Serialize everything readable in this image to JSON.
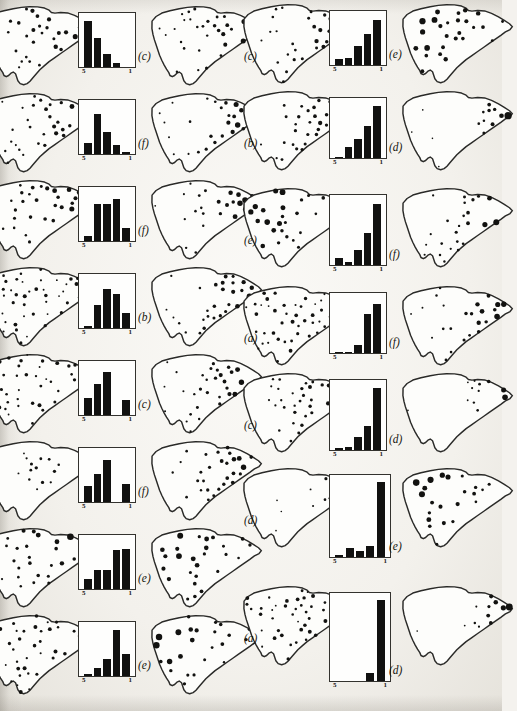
{
  "page": {
    "kind": "scanned-book-figure-page",
    "map_shape": "south-carolina-outline",
    "histogram_axis": {
      "left_tick": "5",
      "right_tick": "1"
    },
    "colors": {
      "ink": "#121210",
      "paper": "#f4f2ee",
      "outline": "#2a2a28"
    }
  },
  "columns": [
    {
      "name": "left-column",
      "rows": [
        {
          "row": 1,
          "left_map": {
            "label": ")",
            "dot_count": 30,
            "pattern": "northeast-heavy"
          },
          "histogram": {
            "type": "bar",
            "categories": [
              "5",
              "4",
              "3",
              "2",
              "1"
            ],
            "values": [
              92,
              58,
              26,
              9,
              0
            ],
            "ylim": [
              0,
              100
            ]
          },
          "right_map_label": "(c)",
          "right_map": {
            "dot_count": 30,
            "pattern": "east-heavy"
          }
        },
        {
          "row": 2,
          "left_map": {
            "label": ")",
            "dot_count": 32,
            "pattern": "east-heavy"
          },
          "histogram": {
            "type": "bar",
            "categories": [
              "5",
              "4",
              "3",
              "2",
              "1"
            ],
            "values": [
              22,
              80,
              44,
              18,
              4
            ],
            "ylim": [
              0,
              100
            ]
          },
          "right_map_label": "(f)",
          "right_map": {
            "dot_count": 26,
            "pattern": "east-large"
          }
        },
        {
          "row": 3,
          "left_map": {
            "label": ")",
            "dot_count": 30,
            "pattern": "northeast-heavy"
          },
          "histogram": {
            "type": "bar",
            "categories": [
              "5",
              "4",
              "3",
              "2",
              "1"
            ],
            "values": [
              10,
              74,
              74,
              84,
              26
            ],
            "ylim": [
              0,
              100
            ]
          },
          "right_map_label": "(f)",
          "right_map": {
            "dot_count": 24,
            "pattern": "east-large"
          }
        },
        {
          "row": 4,
          "left_map": {
            "label": ")",
            "dot_count": 44,
            "pattern": "uniform"
          },
          "histogram": {
            "type": "bar",
            "categories": [
              "5",
              "4",
              "3",
              "2",
              "1"
            ],
            "values": [
              4,
              46,
              78,
              68,
              30
            ],
            "ylim": [
              0,
              100
            ]
          },
          "right_map_label": "(b)",
          "right_map": {
            "dot_count": 28,
            "pattern": "east-heavy"
          }
        },
        {
          "row": 5,
          "left_map": {
            "label": ")",
            "dot_count": 40,
            "pattern": "uniform"
          },
          "histogram": {
            "type": "bar",
            "categories": [
              "5",
              "4",
              "3",
              "2",
              "1"
            ],
            "values": [
              34,
              62,
              86,
              0,
              30
            ],
            "ylim": [
              0,
              100
            ]
          },
          "right_map_label": "(c)",
          "right_map": {
            "dot_count": 30,
            "pattern": "east-heavy"
          }
        },
        {
          "row": 6,
          "left_map": {
            "label": ")",
            "dot_count": 14,
            "pattern": "central-cluster"
          },
          "histogram": {
            "type": "bar",
            "categories": [
              "5",
              "4",
              "3",
              "2",
              "1"
            ],
            "values": [
              32,
              56,
              84,
              0,
              36
            ],
            "ylim": [
              0,
              100
            ]
          },
          "right_map_label": "(f)",
          "right_map": {
            "dot_count": 28,
            "pattern": "east-heavy"
          }
        },
        {
          "row": 7,
          "left_map": {
            "label": ")",
            "dot_count": 28,
            "pattern": "northeast-large"
          },
          "histogram": {
            "type": "bar",
            "categories": [
              "5",
              "4",
              "3",
              "2",
              "1"
            ],
            "values": [
              20,
              38,
              38,
              78,
              80
            ],
            "ylim": [
              0,
              100
            ]
          },
          "right_map_label": "(e)",
          "right_map": {
            "dot_count": 26,
            "pattern": "northwest-large"
          }
        },
        {
          "row": 8,
          "left_map": {
            "label": ")",
            "dot_count": 40,
            "pattern": "uniform"
          },
          "histogram": {
            "type": "bar",
            "categories": [
              "5",
              "4",
              "3",
              "2",
              "1"
            ],
            "values": [
              4,
              16,
              34,
              92,
              44
            ],
            "ylim": [
              0,
              100
            ]
          },
          "right_map_label": "(e)",
          "right_map": {
            "dot_count": 24,
            "pattern": "northwest-large"
          }
        }
      ]
    },
    {
      "name": "right-column",
      "rows": [
        {
          "row": 1,
          "left_map_label": "(c)",
          "left_map": {
            "dot_count": 30,
            "pattern": "east-heavy"
          },
          "histogram": {
            "type": "bar",
            "categories": [
              "5",
              "4",
              "3",
              "2",
              "1"
            ],
            "values": [
              12,
              14,
              38,
              62,
              90
            ],
            "ylim": [
              0,
              100
            ]
          },
          "right_map_label": "(e)",
          "right_map": {
            "dot_count": 26,
            "pattern": "northwest-large"
          }
        },
        {
          "row": 2,
          "left_map_label": "(b)",
          "left_map": {
            "dot_count": 30,
            "pattern": "east-heavy"
          },
          "histogram": {
            "type": "bar",
            "categories": [
              "5",
              "4",
              "3",
              "2",
              "1"
            ],
            "values": [
              2,
              20,
              34,
              58,
              92
            ],
            "ylim": [
              0,
              100
            ]
          },
          "right_map_label": "(d)",
          "right_map": {
            "dot_count": 14,
            "pattern": "east-cluster"
          }
        },
        {
          "row": 3,
          "left_map_label": "(e)",
          "left_map": {
            "dot_count": 26,
            "pattern": "northwest-large"
          },
          "histogram": {
            "type": "bar",
            "categories": [
              "5",
              "4",
              "3",
              "2",
              "1"
            ],
            "values": [
              10,
              5,
              22,
              48,
              92
            ],
            "ylim": [
              0,
              100
            ]
          },
          "right_map_label": "(f)",
          "right_map": {
            "dot_count": 24,
            "pattern": "east-large"
          }
        },
        {
          "row": 4,
          "left_map_label": "(a)",
          "left_map": {
            "dot_count": 44,
            "pattern": "uniform"
          },
          "histogram": {
            "type": "bar",
            "categories": [
              "5",
              "4",
              "3",
              "2",
              "1"
            ],
            "values": [
              2,
              2,
              14,
              70,
              88
            ],
            "ylim": [
              0,
              100
            ]
          },
          "right_map_label": "(f)",
          "right_map": {
            "dot_count": 24,
            "pattern": "east-large"
          }
        },
        {
          "row": 5,
          "left_map_label": "(c)",
          "left_map": {
            "dot_count": 32,
            "pattern": "east-heavy"
          },
          "histogram": {
            "type": "bar",
            "categories": [
              "5",
              "4",
              "3",
              "2",
              "1"
            ],
            "values": [
              3,
              4,
              20,
              36,
              94
            ],
            "ylim": [
              0,
              100
            ]
          },
          "right_map_label": "(d)",
          "right_map": {
            "dot_count": 12,
            "pattern": "east-cluster"
          }
        },
        {
          "row": 6,
          "left_map_label": "(d)",
          "left_map": {
            "dot_count": 12,
            "pattern": "east-cluster"
          },
          "histogram": {
            "type": "bar",
            "categories": [
              "5",
              "4",
              "3",
              "2",
              "1"
            ],
            "values": [
              3,
              12,
              8,
              14,
              96
            ],
            "ylim": [
              0,
              100
            ]
          },
          "right_map_label": "(e)",
          "right_map": {
            "dot_count": 22,
            "pattern": "northwest-large"
          }
        },
        {
          "row": 7,
          "left_map_label": "(a)",
          "left_map": {
            "dot_count": 44,
            "pattern": "uniform"
          },
          "histogram": {
            "type": "bar",
            "categories": [
              "5",
              "4",
              "3",
              "2",
              "1"
            ],
            "values": [
              0,
              0,
              0,
              10,
              97
            ],
            "ylim": [
              0,
              100
            ]
          },
          "right_map_label": "(d)",
          "right_map": {
            "dot_count": 12,
            "pattern": "east-cluster"
          }
        }
      ]
    }
  ]
}
